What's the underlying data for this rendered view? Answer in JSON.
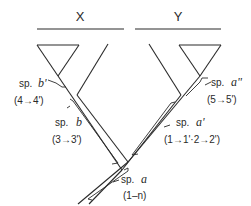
{
  "diagram": {
    "type": "phylogenetic-gene-tree",
    "groups": [
      {
        "label": "X"
      },
      {
        "label": "Y"
      }
    ],
    "species": [
      {
        "name_prefix": "sp.",
        "name": "b'",
        "transition": "(4→4')"
      },
      {
        "name_prefix": "sp.",
        "name": "b",
        "transition": "(3→3')"
      },
      {
        "name_prefix": "sp.",
        "name": "a\"",
        "transition": "(5→5')"
      },
      {
        "name_prefix": "sp.",
        "name": "a'",
        "transition": "(1→1'·2→2')"
      },
      {
        "name_prefix": "sp.",
        "name": "a",
        "transition": "(1–n)"
      }
    ],
    "colors": {
      "line": "#2a2a2a",
      "background": "#ffffff"
    }
  }
}
